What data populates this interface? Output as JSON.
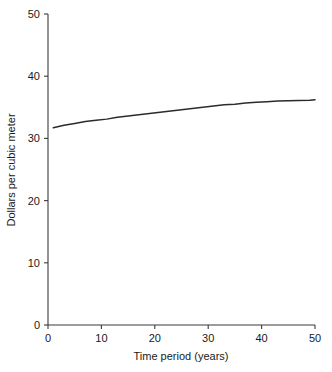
{
  "chart_data": {
    "type": "line",
    "title": "",
    "xlabel": "Time period (years)",
    "ylabel": "Dollars per cubic meter",
    "xlim": [
      0,
      50
    ],
    "ylim": [
      0,
      50
    ],
    "xticks": [
      0,
      10,
      20,
      30,
      40,
      50
    ],
    "yticks": [
      0,
      10,
      20,
      30,
      40,
      50
    ],
    "xtick_labels": [
      "0",
      "10",
      "20",
      "30",
      "40",
      "50"
    ],
    "ytick_labels": [
      "0",
      "10",
      "20",
      "30",
      "40",
      "50"
    ],
    "grid": false,
    "legend": null,
    "series": [
      {
        "name": "Dollars per cubic meter",
        "color": "#2b2b2b",
        "x": [
          1,
          3,
          5,
          7,
          9,
          11,
          13,
          15,
          17,
          19,
          21,
          23,
          25,
          27,
          29,
          31,
          33,
          35,
          37,
          39,
          41,
          43,
          45,
          47,
          49,
          50
        ],
        "values": [
          31.7,
          32.1,
          32.4,
          32.7,
          32.9,
          33.1,
          33.4,
          33.6,
          33.8,
          34.0,
          34.2,
          34.4,
          34.6,
          34.8,
          35.0,
          35.2,
          35.4,
          35.5,
          35.7,
          35.8,
          35.9,
          36.0,
          36.05,
          36.1,
          36.15,
          36.2
        ]
      }
    ]
  },
  "axis": {
    "x_title": "Time period (years)",
    "y_title": "Dollars per cubic meter"
  }
}
